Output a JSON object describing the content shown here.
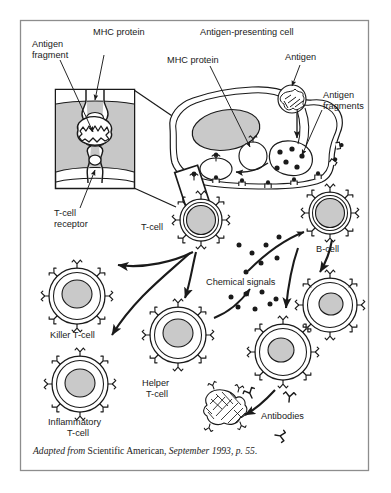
{
  "figure": {
    "kind": "immunology-diagram",
    "title_absent": true,
    "frame": {
      "border_color": "#8d8d8d",
      "background": "#ffffff"
    },
    "palette": {
      "ink": "#1a1a1a",
      "cell_fill": "#ffffff",
      "nucleus_fill": "#c9c9c9",
      "inset_fill": "#c7c7c7",
      "antigen_fill": "#8a8a8a"
    }
  },
  "labels": {
    "antigen_fragment": "Antigen\nfragment",
    "antigen_fragment_l1": "Antigen",
    "antigen_fragment_l2": "fragment",
    "mhc_protein_inset": "MHC protein",
    "mhc_protein_apc": "MHC protein",
    "antigen_presenting_cell": "Antigen-presenting cell",
    "antigen": "Antigen",
    "antigen_fragments_l1": "Antigen",
    "antigen_fragments_l2": "fragments",
    "t_cell_receptor_l1": "T-cell",
    "t_cell_receptor_l2": "receptor",
    "t_cell": "T-cell",
    "b_cell": "B-cell",
    "chemical_signals": "Chemical signals",
    "killer_t_cell": "Killer T-cell",
    "helper_t_cell_l1": "Helper",
    "helper_t_cell_l2": "T-cell",
    "inflammatory_t_cell_l1": "Inflammatory",
    "inflammatory_t_cell_l2": "T-cell",
    "antibodies": "Antibodies"
  },
  "caption": {
    "lead_italic": "Adapted from",
    "source_roman": "Scientific American,",
    "date_italic": "September 1993, p. 55."
  }
}
